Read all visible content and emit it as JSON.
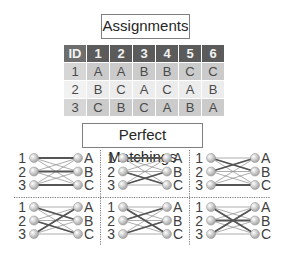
{
  "titles": {
    "assignments": "Assignments",
    "matchings": "Perfect Matchings"
  },
  "table": {
    "headers": [
      "ID",
      "1",
      "2",
      "3",
      "4",
      "5",
      "6"
    ],
    "rows": [
      [
        "1",
        "A",
        "A",
        "B",
        "B",
        "C",
        "C"
      ],
      [
        "2",
        "B",
        "C",
        "A",
        "C",
        "A",
        "B"
      ],
      [
        "3",
        "C",
        "B",
        "C",
        "A",
        "B",
        "A"
      ]
    ]
  },
  "graph": {
    "left_labels": [
      "1",
      "2",
      "3"
    ],
    "right_labels": [
      "A",
      "B",
      "C"
    ],
    "matchings": [
      {
        "1": "A",
        "2": "B",
        "3": "C"
      },
      {
        "1": "A",
        "2": "C",
        "3": "B"
      },
      {
        "1": "B",
        "2": "A",
        "3": "C"
      },
      {
        "1": "B",
        "2": "C",
        "3": "A"
      },
      {
        "1": "C",
        "2": "A",
        "3": "B"
      },
      {
        "1": "C",
        "2": "B",
        "3": "A"
      }
    ]
  },
  "colors": {
    "header_bg": "#5b5b5b",
    "row_dark": "#cbcbcb",
    "row_light": "#ececec",
    "edge_thin": "#8a8a8a",
    "edge_thick": "#555555",
    "node_fill": "#d9d9d9"
  }
}
